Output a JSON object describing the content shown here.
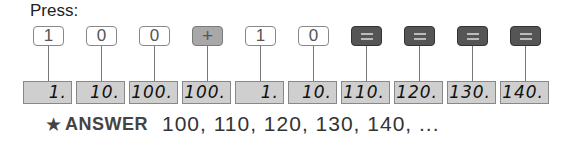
{
  "press_label": "Press:",
  "steps": [
    {
      "key": "1",
      "type": "num",
      "display": "1."
    },
    {
      "key": "0",
      "type": "num",
      "display": "10."
    },
    {
      "key": "0",
      "type": "num",
      "display": "100."
    },
    {
      "key": "+",
      "type": "plus",
      "display": "100."
    },
    {
      "key": "1",
      "type": "num",
      "display": "1."
    },
    {
      "key": "0",
      "type": "num",
      "display": "10."
    },
    {
      "key": "=",
      "type": "eq",
      "display": "110."
    },
    {
      "key": "=",
      "type": "eq",
      "display": "120."
    },
    {
      "key": "=",
      "type": "eq",
      "display": "130."
    },
    {
      "key": "=",
      "type": "eq",
      "display": "140."
    }
  ],
  "answer": {
    "icon": "star-icon",
    "label": "ANSWER",
    "value": "100, 110, 120, 130, 140, ..."
  }
}
